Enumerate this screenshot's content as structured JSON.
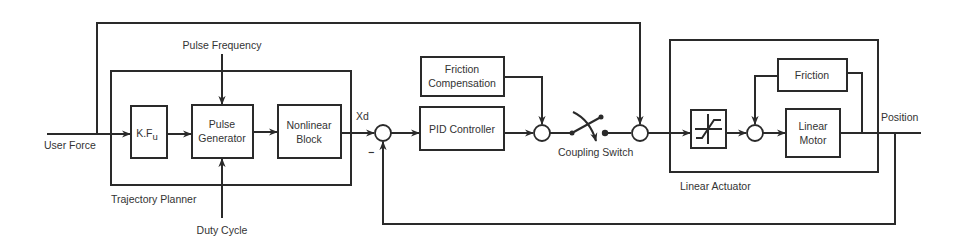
{
  "diagram": {
    "type": "control-system-block-diagram",
    "input_label": "User Force",
    "output_label": "Position",
    "signal_xd": "Xd",
    "minus_sign": "−",
    "trajectory_planner": {
      "label": "Trajectory Planner",
      "pulse_frequency_label": "Pulse Frequency",
      "duty_cycle_label": "Duty Cycle",
      "kfu_block": {
        "main": "K.F",
        "sub": "u"
      },
      "pulse_generator": {
        "line1": "Pulse",
        "line2": "Generator"
      },
      "nonlinear_block": {
        "line1": "Nonlinear",
        "line2": "Block"
      }
    },
    "pid_controller": "PID Controller",
    "friction_compensation": {
      "line1": "Friction",
      "line2": "Compensation"
    },
    "coupling_switch_label": "Coupling Switch",
    "linear_actuator": {
      "label": "Linear Actuator",
      "saturation_block": "saturation",
      "friction": "Friction",
      "linear_motor": {
        "line1": "Linear",
        "line2": "Motor"
      }
    },
    "colors": {
      "stroke": "#2a2a2a",
      "text": "#333333",
      "background": "#ffffff"
    }
  }
}
